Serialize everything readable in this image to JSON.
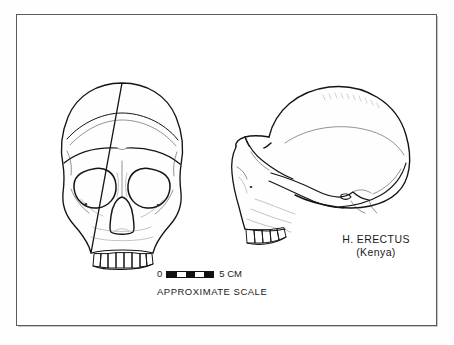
{
  "plate": {
    "kind": "scientific-illustration-plate",
    "background_color": "#ffffff",
    "frame_color": "#5a5a5a",
    "ink_color": "#141414"
  },
  "figures": [
    {
      "id": "skull-front",
      "view": "frontal",
      "subject": "hominid cranium",
      "description": "Anterior view of H. erectus cranium with large circular orbits, pear-shaped nasal aperture and upper dentition"
    },
    {
      "id": "skull-lateral",
      "view": "lateral",
      "subject": "hominid cranium",
      "description": "Left lateral view of H. erectus cranium showing long low vault, pronounced supraorbital torus, zygomatic arch and maxillary dentition"
    }
  ],
  "label": {
    "line1": "H. ERECTUS",
    "line2": "(Kenya)"
  },
  "scale": {
    "min_label": "0",
    "max_label": "5 CM",
    "caption": "APPROXIMATE SCALE",
    "segments": [
      "on",
      "off",
      "on",
      "off",
      "on"
    ],
    "segment_count": 5,
    "unit": "CM",
    "span": 5
  }
}
